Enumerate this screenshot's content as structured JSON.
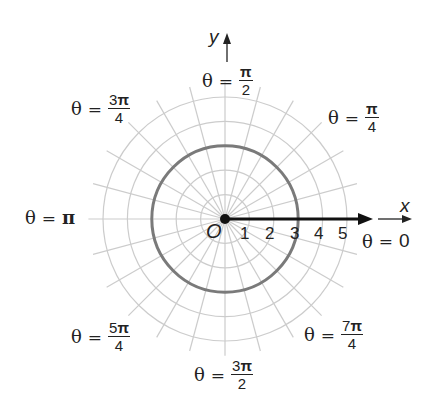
{
  "diagram": {
    "type": "polar-grid",
    "center_label": "O",
    "axis_labels": {
      "x": "x",
      "y": "y"
    },
    "rings": [
      1,
      2,
      3,
      4,
      5
    ],
    "radial_spacing_deg": 15,
    "highlighted_circle": {
      "r": 3,
      "color": "#7a7a7a"
    },
    "ray": {
      "from_r": 0,
      "to_r": 6.2,
      "angle": "0",
      "color": "#111111"
    },
    "grid_color": "#cccccc",
    "radius_ticks": [
      "1",
      "2",
      "3",
      "4",
      "5"
    ],
    "angle_labels": [
      {
        "id": "0",
        "prefix": "θ",
        "eq": "=",
        "num_digit": "",
        "num_sym": "0",
        "den": "",
        "single": true
      },
      {
        "id": "pi4",
        "prefix": "θ",
        "eq": "=",
        "num_digit": "",
        "num_sym": "π",
        "den": "4"
      },
      {
        "id": "pi2",
        "prefix": "θ",
        "eq": "=",
        "num_digit": "",
        "num_sym": "π",
        "den": "2"
      },
      {
        "id": "3pi4",
        "prefix": "θ",
        "eq": "=",
        "num_digit": "3",
        "num_sym": "π",
        "den": "4"
      },
      {
        "id": "pi",
        "prefix": "θ",
        "eq": "=",
        "num_digit": "",
        "num_sym": "π",
        "den": "",
        "single": true
      },
      {
        "id": "5pi4",
        "prefix": "θ",
        "eq": "=",
        "num_digit": "5",
        "num_sym": "π",
        "den": "4"
      },
      {
        "id": "3pi2",
        "prefix": "θ",
        "eq": "=",
        "num_digit": "3",
        "num_sym": "π",
        "den": "2"
      },
      {
        "id": "7pi4",
        "prefix": "θ",
        "eq": "=",
        "num_digit": "7",
        "num_sym": "π",
        "den": "4"
      }
    ]
  }
}
